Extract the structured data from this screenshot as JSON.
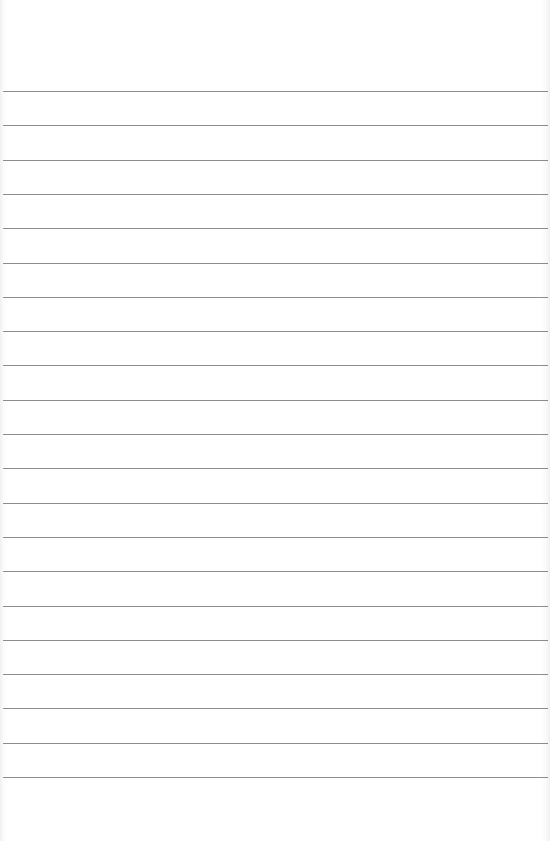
{
  "page": {
    "type": "lined-paper",
    "background_color": "#ffffff",
    "line_color": "#8c8c8c",
    "line_count": 21,
    "first_line_y": 91,
    "line_spacing_px": 34.3,
    "text_content": ""
  }
}
